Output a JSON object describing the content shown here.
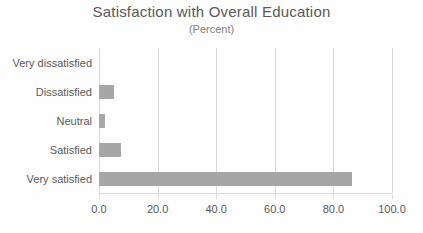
{
  "chart_data": {
    "type": "bar",
    "orientation": "horizontal",
    "title": "Satisfaction with Overall Education",
    "subtitle": "(Percent)",
    "categories": [
      "Very dissatisfied",
      "Dissatisfied",
      "Neutral",
      "Satisfied",
      "Very satisfied"
    ],
    "values": [
      0.0,
      5.0,
      2.2,
      7.5,
      86.5
    ],
    "xlabel": "",
    "ylabel": "",
    "xlim": [
      0,
      100
    ],
    "xticks": [
      0,
      20,
      40,
      60,
      80,
      100
    ],
    "xtick_labels": [
      "0.0",
      "20.0",
      "40.0",
      "60.0",
      "80.0",
      "100.0"
    ],
    "grid": "vertical-only",
    "legend": "none",
    "colors": {
      "bar": "#a6a6a6",
      "gridline": "#d9d9d9",
      "text": "#595959",
      "subtitle": "#808080",
      "background": "#fefefe"
    }
  }
}
